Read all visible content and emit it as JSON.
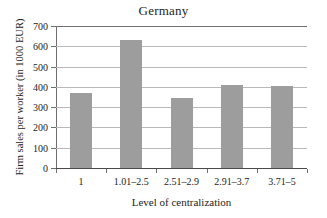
{
  "chart_data": {
    "type": "bar",
    "title": "Germany",
    "xlabel": "Level of centralization",
    "ylabel": "Firm sales per worker (in 1000 EUR)",
    "categories": [
      "1",
      "1.01–2.5",
      "2.51–2.9",
      "2.91–3.7",
      "3.71–5"
    ],
    "values": [
      370,
      630,
      345,
      410,
      405
    ],
    "ylim": [
      0,
      700
    ],
    "yticks": [
      0,
      100,
      200,
      300,
      400,
      500,
      600,
      700
    ],
    "ytick_labels": [
      "0",
      "100",
      "200",
      "300",
      "400",
      "500",
      "600",
      "700"
    ],
    "grid": true,
    "legend": null,
    "bar_color": "#9d9d9d",
    "grid_color": "#b9b9b9",
    "axis_color": "#6f6f6f",
    "background": "#ffffff"
  }
}
